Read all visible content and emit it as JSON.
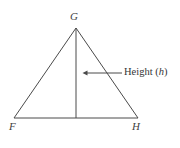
{
  "figure": {
    "kind": "geometry-diagram",
    "shape": "triangle",
    "background_color": "#ffffff",
    "stroke_color": "#4a4a4a",
    "text_color": "#3f3f3f",
    "stroke_width": 1,
    "width": 180,
    "height": 148
  },
  "triangle": {
    "vertices": [
      {
        "name": "G",
        "label": "G",
        "x": 76,
        "y": 28,
        "position": "apex"
      },
      {
        "name": "F",
        "label": "F",
        "x": 14,
        "y": 118,
        "position": "bottom-left"
      },
      {
        "name": "H",
        "label": "H",
        "x": 138,
        "y": 118,
        "position": "bottom-right"
      }
    ],
    "edges": [
      {
        "from": "F",
        "to": "G"
      },
      {
        "from": "G",
        "to": "H"
      },
      {
        "from": "F",
        "to": "H"
      }
    ]
  },
  "height_segment": {
    "from_x": 76,
    "from_y": 28,
    "to_x": 76,
    "to_y": 118,
    "description": "altitude from G perpendicular to FH"
  },
  "annotation": {
    "text_prefix": "Height (",
    "variable": "h",
    "text_suffix": ")",
    "full_text": "Height (h)",
    "leader_line": {
      "tail_x": 122,
      "tail_y": 73,
      "tip_x": 83,
      "tip_y": 73,
      "direction": "left"
    }
  }
}
